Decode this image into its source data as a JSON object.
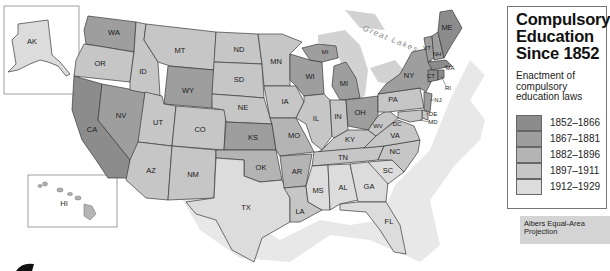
{
  "legend": {
    "title_lines": [
      "Compulsory",
      "Education",
      "Since 1852"
    ],
    "subtitle_lines": [
      "Enactment of",
      "compulsory",
      "education laws"
    ],
    "items": [
      {
        "label": "1852–1866",
        "color": "#8c8c8c"
      },
      {
        "label": "1867–1881",
        "color": "#9e9e9e"
      },
      {
        "label": "1882–1896",
        "color": "#b4b4b4"
      },
      {
        "label": "1897–1911",
        "color": "#c6c6c6"
      },
      {
        "label": "1912–1929",
        "color": "#dcdcdc"
      }
    ]
  },
  "projection_lines": [
    "Albers Equal-Area",
    "Projection"
  ],
  "water_label": "Great Lakes",
  "states": {
    "AK": "AK",
    "HI": "HI",
    "WA": "WA",
    "OR": "OR",
    "CA": "CA",
    "NV": "NV",
    "ID": "ID",
    "MT": "MT",
    "WY": "WY",
    "UT": "UT",
    "CO": "CO",
    "AZ": "AZ",
    "NM": "NM",
    "ND": "ND",
    "SD": "SD",
    "NE": "NE",
    "KS": "KS",
    "OK": "OK",
    "TX": "TX",
    "MN": "MN",
    "IA": "IA",
    "MO": "MO",
    "AR": "AR",
    "LA": "LA",
    "WI": "WI",
    "IL": "IL",
    "MI": "MI",
    "MI_UP": "MI",
    "IN": "IN",
    "OH": "OH",
    "KY": "KY",
    "TN": "TN",
    "MS": "MS",
    "AL": "AL",
    "GA": "GA",
    "FL": "FL",
    "SC": "SC",
    "NC": "NC",
    "VA": "VA",
    "WV": "WV",
    "PA": "PA",
    "NY": "NY",
    "VT": "VT",
    "NH": "NH",
    "ME": "ME",
    "MA": "MA",
    "CT": "CT",
    "RI": "RI",
    "NJ": "NJ",
    "DE": "DE",
    "MD": "MD",
    "DC": "DC"
  },
  "colors": {
    "c1": "#8c8c8c",
    "c2": "#9e9e9e",
    "c3": "#b4b4b4",
    "c4": "#c6c6c6",
    "c5": "#dcdcdc",
    "shadow": "#e6e6e6",
    "lake": "#d0d0d0"
  }
}
